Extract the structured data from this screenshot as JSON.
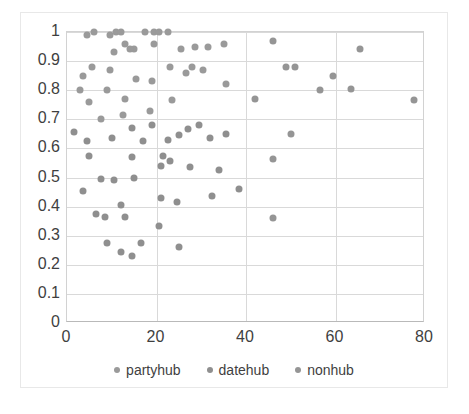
{
  "chart_data": {
    "type": "scatter",
    "title": "",
    "xlabel": "",
    "ylabel": "",
    "xlim": [
      0,
      80
    ],
    "ylim": [
      0,
      1
    ],
    "xticks": [
      0,
      20,
      40,
      60,
      80
    ],
    "yticks": [
      0,
      0.1,
      0.2,
      0.3,
      0.4,
      0.5,
      0.6,
      0.7,
      0.8,
      0.9,
      1
    ],
    "ytick_labels": [
      "0",
      "0.1",
      "0.2",
      "0.3",
      "0.4",
      "0.5",
      "0.6",
      "0.7",
      "0.8",
      "0.9",
      "1"
    ],
    "xtick_labels": [
      "0",
      "20",
      "40",
      "60",
      "80"
    ],
    "grid": true,
    "legend_position": "bottom",
    "marker_color": "#9a9a9a",
    "series": [
      {
        "name": "partyhub",
        "color": "#9a9a9a",
        "points": [
          [
            6.0,
            1.0
          ],
          [
            9.5,
            0.99
          ],
          [
            11.0,
            1.0
          ],
          [
            12.0,
            1.0
          ],
          [
            17.5,
            1.0
          ],
          [
            19.5,
            1.0
          ],
          [
            20.5,
            1.0
          ],
          [
            22.5,
            1.0
          ],
          [
            4.5,
            0.99
          ],
          [
            13.0,
            0.96
          ],
          [
            15.0,
            0.94
          ],
          [
            14.0,
            0.94
          ],
          [
            10.5,
            0.93
          ],
          [
            19.5,
            0.96
          ],
          [
            25.5,
            0.94
          ],
          [
            28.5,
            0.95
          ],
          [
            31.5,
            0.95
          ],
          [
            35.0,
            0.96
          ],
          [
            5.5,
            0.88
          ],
          [
            9.5,
            0.87
          ],
          [
            23.0,
            0.88
          ],
          [
            28.0,
            0.88
          ],
          [
            26.5,
            0.86
          ],
          [
            30.5,
            0.87
          ],
          [
            3.5,
            0.85
          ],
          [
            15.5,
            0.84
          ],
          [
            19.0,
            0.83
          ],
          [
            35.5,
            0.82
          ],
          [
            3.0,
            0.8
          ],
          [
            9.0,
            0.8
          ],
          [
            13.0,
            0.77
          ],
          [
            23.5,
            0.765
          ],
          [
            5.0,
            0.76
          ],
          [
            7.5,
            0.7
          ],
          [
            12.5,
            0.715
          ],
          [
            18.5,
            0.73
          ]
        ]
      },
      {
        "name": "datehub",
        "color": "#8f8f8f",
        "points": [
          [
            1.5,
            0.655
          ],
          [
            19.0,
            0.68
          ],
          [
            29.5,
            0.68
          ],
          [
            14.5,
            0.67
          ],
          [
            27.0,
            0.665
          ],
          [
            4.5,
            0.625
          ],
          [
            10.0,
            0.635
          ],
          [
            17.0,
            0.625
          ],
          [
            22.5,
            0.63
          ],
          [
            25.0,
            0.645
          ],
          [
            32.0,
            0.635
          ],
          [
            35.5,
            0.65
          ],
          [
            5.0,
            0.575
          ],
          [
            14.5,
            0.57
          ],
          [
            21.5,
            0.575
          ],
          [
            23.0,
            0.555
          ],
          [
            21.0,
            0.54
          ],
          [
            27.5,
            0.535
          ],
          [
            34.0,
            0.525
          ],
          [
            7.5,
            0.495
          ],
          [
            10.5,
            0.49
          ],
          [
            15.0,
            0.5
          ],
          [
            3.5,
            0.455
          ],
          [
            21.0,
            0.43
          ],
          [
            24.5,
            0.415
          ],
          [
            32.5,
            0.435
          ],
          [
            38.5,
            0.46
          ],
          [
            12.0,
            0.405
          ],
          [
            6.5,
            0.375
          ],
          [
            8.5,
            0.365
          ],
          [
            13.0,
            0.365
          ],
          [
            20.5,
            0.333
          ],
          [
            9.0,
            0.275
          ],
          [
            16.5,
            0.275
          ],
          [
            12.0,
            0.243
          ],
          [
            14.5,
            0.23
          ],
          [
            25.0,
            0.26
          ]
        ]
      },
      {
        "name": "nonhub",
        "color": "#959595",
        "points": [
          [
            46.0,
            0.97
          ],
          [
            65.5,
            0.94
          ],
          [
            49.0,
            0.88
          ],
          [
            51.0,
            0.88
          ],
          [
            59.5,
            0.85
          ],
          [
            56.5,
            0.8
          ],
          [
            63.5,
            0.805
          ],
          [
            42.0,
            0.77
          ],
          [
            77.5,
            0.765
          ],
          [
            50.0,
            0.65
          ],
          [
            46.0,
            0.565
          ],
          [
            46.0,
            0.362
          ]
        ]
      }
    ]
  },
  "legend": {
    "items": [
      {
        "label": "partyhub",
        "marker": "legend-marker-dot"
      },
      {
        "label": "datehub",
        "marker": "legend-marker-dot"
      },
      {
        "label": "nonhub",
        "marker": "legend-marker-dot"
      }
    ]
  }
}
